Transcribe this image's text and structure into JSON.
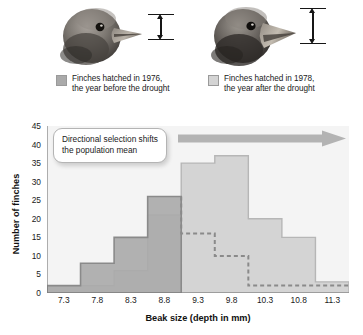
{
  "figure": {
    "specimens": [
      {
        "id": "finch-1976",
        "icon": "finch-head-icon",
        "caliper": "beak-depth-caliper-icon",
        "beak_depth_relative": "smaller"
      },
      {
        "id": "finch-1978",
        "icon": "finch-head-icon",
        "caliper": "beak-depth-caliper-icon",
        "beak_depth_relative": "larger"
      }
    ],
    "legend": [
      {
        "swatch_color": "#aaaaaa",
        "line1": "Finches hatched in 1976,",
        "line2": "the year before the drought"
      },
      {
        "swatch_color": "#d4d4d4",
        "line1": "Finches hatched in 1978,",
        "line2": "the year after the drought"
      }
    ],
    "callout": {
      "text": "Directional selection shifts the population mean"
    },
    "arrow": {
      "name": "rightward-shift-arrow",
      "color": "#b0b0b0",
      "direction": "right"
    }
  },
  "chart_data": {
    "type": "bar",
    "title": "",
    "xlabel": "Beak size (depth in mm)",
    "ylabel": "Number of finches",
    "categories": [
      "7.3",
      "7.8",
      "8.3",
      "8.8",
      "9.3",
      "9.8",
      "10.3",
      "10.8",
      "11.3"
    ],
    "yticks": [
      0,
      5,
      10,
      15,
      20,
      25,
      30,
      35,
      40,
      45
    ],
    "ylim": [
      0,
      45
    ],
    "grid": false,
    "legend_position": "above-plot",
    "series": [
      {
        "name": "Finches hatched in 1976, the year before the drought",
        "color": "#aaaaaa",
        "stroke": "#8a8a8a",
        "dashed_tail_from": "9.3",
        "values": [
          2,
          8,
          15,
          26,
          16,
          10,
          2,
          2,
          2
        ]
      },
      {
        "name": "Finches hatched in 1978, the year after the drought",
        "color": "#d4d4d4",
        "stroke": "#b6b6b6",
        "values": [
          2,
          2,
          6,
          21,
          35,
          37,
          20,
          15,
          3
        ]
      }
    ]
  }
}
